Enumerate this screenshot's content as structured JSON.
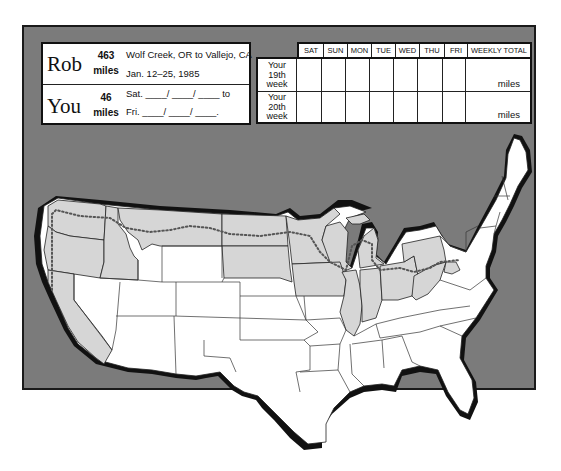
{
  "info": {
    "rob": {
      "name": "Rob",
      "miles_value": "463",
      "miles_unit": "miles",
      "route": "Wolf Creek, OR to Vallejo, CA",
      "dates": "Jan. 12–25, 1985"
    },
    "you": {
      "name": "You",
      "miles_value": "46",
      "miles_unit": "miles",
      "start_line": "Sat. ____/ ____/ ____ to",
      "end_line": "Fri. ____/ ____/ ____."
    }
  },
  "log_table": {
    "columns": [
      "SAT",
      "SUN",
      "MON",
      "TUE",
      "WED",
      "THU",
      "FRI",
      "WEEKLY TOTAL"
    ],
    "rows": [
      {
        "label_lines": [
          "Your",
          "19th",
          "week"
        ],
        "total_unit": "miles"
      },
      {
        "label_lines": [
          "Your",
          "20th",
          "week"
        ],
        "total_unit": "miles"
      }
    ]
  },
  "map": {
    "title": "United States route map",
    "colors": {
      "frame_bg": "#7b7b7b",
      "traveled_states": "#d6d6d6",
      "untraveled_states": "#ffffff",
      "coast_shadow": "#111111",
      "route_dots": "#555555"
    },
    "legend": {
      "traveled": "shaded states (route traveled)",
      "route": "dotted line (running route)"
    }
  }
}
